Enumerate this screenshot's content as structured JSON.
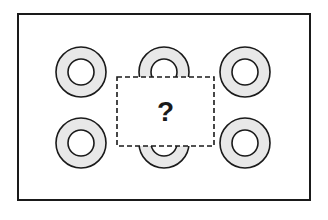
{
  "puzzle": {
    "question_mark": "?",
    "frame": {
      "x": 18,
      "y": 14,
      "width": 292,
      "height": 186
    },
    "ring": {
      "outer_radius": 25,
      "inner_radius": 13,
      "fill": "#e8e8e8",
      "stroke": "#1a1a1a"
    },
    "rings": [
      {
        "id": "top-left",
        "cx": 81,
        "cy": 72
      },
      {
        "id": "top-center",
        "cx": 164,
        "cy": 72
      },
      {
        "id": "top-right",
        "cx": 245,
        "cy": 72
      },
      {
        "id": "bottom-left",
        "cx": 81,
        "cy": 143
      },
      {
        "id": "bottom-center",
        "cx": 164,
        "cy": 143
      },
      {
        "id": "bottom-right",
        "cx": 245,
        "cy": 143
      }
    ],
    "hidden_region": {
      "x": 117,
      "y": 77,
      "width": 97,
      "height": 69
    }
  }
}
